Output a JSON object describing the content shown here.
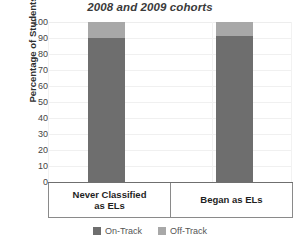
{
  "chart_data": {
    "type": "bar",
    "stacked": true,
    "title": "2008 and 2009 cohorts",
    "title_clipped_above": "Percentage of students on-track,",
    "xlabel": "",
    "ylabel": "Percentage of Students",
    "ylim": [
      0,
      100
    ],
    "ytick_step": 10,
    "grid": true,
    "legend_position": "bottom-center",
    "categories": [
      "Never Classified as ELs",
      "Began as ELs"
    ],
    "category_labels": [
      {
        "line1": "Never Classified",
        "line2": "as ELs"
      },
      {
        "line1": "Began as ELs",
        "line2": ""
      }
    ],
    "series": [
      {
        "name": "On-Track",
        "color": "#6e6e6e",
        "values": [
          90,
          91
        ]
      },
      {
        "name": "Off-Track",
        "color": "#a8a8a8",
        "values": [
          10,
          9
        ]
      }
    ],
    "ytick_labels": [
      "100",
      "90",
      "80",
      "70",
      "60",
      "50",
      "40",
      "30",
      "20",
      "10",
      "0"
    ]
  },
  "legend": {
    "items": [
      {
        "label": "On-Track",
        "swatch": "on"
      },
      {
        "label": "Off-Track",
        "swatch": "off"
      }
    ]
  }
}
